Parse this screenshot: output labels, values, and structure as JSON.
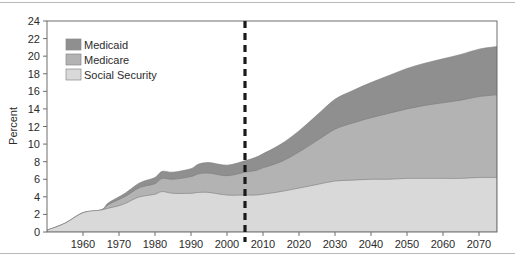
{
  "chart_data": {
    "type": "area",
    "stacked": true,
    "title": "",
    "xlabel": "",
    "ylabel": "Percent",
    "xlim": [
      1950,
      2075
    ],
    "ylim": [
      0,
      24
    ],
    "yticks": [
      0,
      2,
      4,
      6,
      8,
      10,
      12,
      14,
      16,
      18,
      20,
      22,
      24
    ],
    "xticks": [
      1960,
      1970,
      1980,
      1990,
      2000,
      2010,
      2020,
      2030,
      2040,
      2050,
      2060,
      2070
    ],
    "grid": false,
    "legend_position": "top-left",
    "legend": [
      "Medicaid",
      "Medicare",
      "Social Security"
    ],
    "annotations": [
      {
        "type": "vertical-dashed-line",
        "x": 2005,
        "label": ""
      }
    ],
    "x": [
      1950,
      1955,
      1960,
      1965,
      1967,
      1970,
      1972,
      1975,
      1977,
      1980,
      1982,
      1985,
      1990,
      1992,
      1995,
      2000,
      2005,
      2008,
      2010,
      2015,
      2020,
      2025,
      2030,
      2035,
      2040,
      2045,
      2050,
      2055,
      2060,
      2065,
      2070,
      2075
    ],
    "series": [
      {
        "name": "Social Security",
        "color": "#d9d9d9",
        "values": [
          0.2,
          1.0,
          2.2,
          2.5,
          2.7,
          3.0,
          3.3,
          3.9,
          4.1,
          4.3,
          4.6,
          4.4,
          4.4,
          4.5,
          4.5,
          4.2,
          4.2,
          4.2,
          4.3,
          4.6,
          5.0,
          5.4,
          5.8,
          5.9,
          6.0,
          6.0,
          6.1,
          6.1,
          6.1,
          6.1,
          6.2,
          6.2
        ]
      },
      {
        "name": "Medicare",
        "color": "#b3b3b3",
        "values": [
          0.0,
          0.0,
          0.0,
          0.0,
          0.4,
          0.7,
          0.8,
          1.0,
          1.1,
          1.2,
          1.5,
          1.6,
          1.9,
          2.1,
          2.2,
          2.2,
          2.6,
          2.8,
          3.0,
          3.4,
          4.1,
          5.0,
          5.9,
          6.5,
          7.0,
          7.5,
          7.9,
          8.3,
          8.6,
          8.9,
          9.2,
          9.4
        ]
      },
      {
        "name": "Medicaid",
        "color": "#8f8f8f",
        "values": [
          0.0,
          0.0,
          0.0,
          0.0,
          0.2,
          0.3,
          0.4,
          0.5,
          0.6,
          0.7,
          0.8,
          0.8,
          0.9,
          1.1,
          1.2,
          1.2,
          1.3,
          1.5,
          1.6,
          2.0,
          2.4,
          2.9,
          3.4,
          3.7,
          4.0,
          4.3,
          4.6,
          4.8,
          5.0,
          5.2,
          5.4,
          5.5
        ]
      }
    ],
    "totals_note": {
      "2030": 14.6,
      "2070": 20.8
    }
  },
  "axis": {
    "ylabel": "Percent",
    "ytick_labels": [
      "24",
      "22",
      "20",
      "18",
      "16",
      "14",
      "12",
      "10",
      "8",
      "6",
      "4",
      "2",
      "0"
    ],
    "xtick_labels": [
      "1960",
      "1970",
      "1980",
      "1990",
      "2000",
      "2010",
      "2020",
      "2030",
      "2040",
      "2050",
      "2060",
      "2070"
    ]
  },
  "legend": {
    "items": [
      {
        "label": "Medicaid",
        "color": "#8f8f8f"
      },
      {
        "label": "Medicare",
        "color": "#b3b3b3"
      },
      {
        "label": "Social Security",
        "color": "#d9d9d9"
      }
    ]
  },
  "style": {
    "frame_color": "#6e6e6e",
    "rule_color": "#b9b9b9",
    "dashed_line_color": "#1a1a1a",
    "background": "#ffffff"
  }
}
